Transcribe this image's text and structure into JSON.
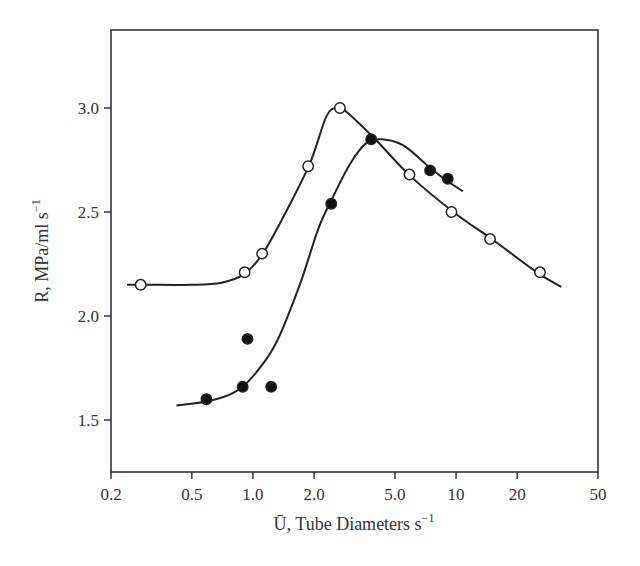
{
  "chart_data": {
    "type": "scatter",
    "title": "",
    "xlabel": "Ū, Tube Diameters s⁻¹",
    "xlabel_main": "U, Tube Diameters s",
    "xlabel_sup": "−1",
    "ylabel": "R, MPa/ml s⁻¹",
    "ylabel_main": "R, MPa/ml s",
    "ylabel_sup": "−1",
    "xscale": "log",
    "xlim": [
      0.2,
      50
    ],
    "ylim": [
      1.25,
      3.35
    ],
    "grid": false,
    "legend": null,
    "x_ticks": [
      0.2,
      0.5,
      1.0,
      2.0,
      5.0,
      10,
      20,
      50
    ],
    "x_tick_labels": [
      "0.2",
      "0.5",
      "1.0",
      "2.0",
      "5.0",
      "10",
      "20",
      "50"
    ],
    "y_ticks": [
      1.5,
      2.0,
      2.5,
      3.0
    ],
    "y_tick_labels": [
      "1.5",
      "2.0",
      "2.5",
      "3.0"
    ],
    "series": [
      {
        "name": "open circles",
        "marker": "open-circle",
        "x": [
          0.28,
          0.91,
          1.11,
          1.87,
          2.68,
          5.9,
          9.5,
          14.7,
          25.9
        ],
        "y": [
          2.15,
          2.21,
          2.3,
          2.72,
          3.0,
          2.68,
          2.5,
          2.37,
          2.21
        ],
        "curve": {
          "x": [
            0.24,
            0.3,
            0.5,
            0.7,
            0.9,
            1.1,
            1.4,
            1.9,
            2.3,
            2.6,
            2.9,
            4.0,
            6.0,
            10,
            15,
            25,
            33
          ],
          "y": [
            2.15,
            2.15,
            2.15,
            2.16,
            2.2,
            2.29,
            2.47,
            2.73,
            2.96,
            3.0,
            2.98,
            2.85,
            2.67,
            2.49,
            2.37,
            2.21,
            2.14
          ]
        }
      },
      {
        "name": "filled circles",
        "marker": "filled-circle",
        "x": [
          0.59,
          0.89,
          0.94,
          1.23,
          2.43,
          3.82,
          7.45,
          9.1
        ],
        "y": [
          1.6,
          1.66,
          1.89,
          1.66,
          2.54,
          2.85,
          2.7,
          2.66
        ],
        "curve": {
          "x": [
            0.42,
            0.6,
            0.8,
            1.0,
            1.3,
            1.7,
            2.1,
            2.5,
            3.0,
            3.6,
            4.3,
            5.5,
            7.5,
            9.0,
            10.8
          ],
          "y": [
            1.57,
            1.59,
            1.63,
            1.71,
            1.87,
            2.15,
            2.42,
            2.58,
            2.73,
            2.83,
            2.85,
            2.82,
            2.71,
            2.65,
            2.6
          ]
        }
      }
    ]
  }
}
